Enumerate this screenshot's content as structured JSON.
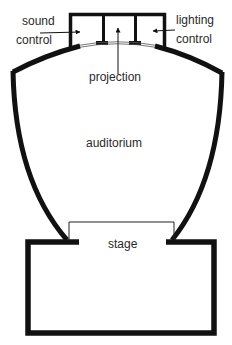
{
  "diagram": {
    "type": "floor-plan",
    "colors": {
      "background": "#ffffff",
      "wall": "#111111",
      "text": "#2a2a2a"
    },
    "labels": {
      "sound": "sound",
      "sound_control": "control",
      "lighting": "lighting",
      "lighting_control": "control",
      "projection": "projection",
      "auditorium": "auditorium",
      "stage": "stage"
    },
    "regions": [
      {
        "id": "sound-control-room",
        "label": "sound control"
      },
      {
        "id": "projection-room",
        "label": "projection"
      },
      {
        "id": "lighting-control-room",
        "label": "lighting control"
      },
      {
        "id": "auditorium",
        "label": "auditorium"
      },
      {
        "id": "stage",
        "label": "stage"
      }
    ],
    "arrows": [
      {
        "from": "sound control label",
        "to": "sound-control-room"
      },
      {
        "from": "projection label",
        "to": "projection-room"
      },
      {
        "from": "lighting control label",
        "to": "lighting-control-room"
      }
    ]
  }
}
